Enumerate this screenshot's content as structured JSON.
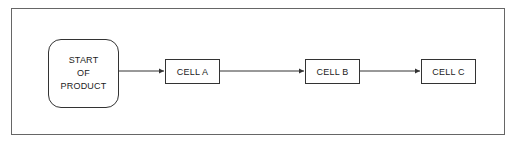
{
  "diagram": {
    "type": "flowchart",
    "start": {
      "lines": [
        "START",
        "OF",
        "PRODUCT"
      ]
    },
    "cells": [
      {
        "label": "CELL A"
      },
      {
        "label": "CELL B"
      },
      {
        "label": "CELL C"
      }
    ],
    "edges": [
      {
        "from": "START OF PRODUCT",
        "to": "CELL A"
      },
      {
        "from": "CELL A",
        "to": "CELL B"
      },
      {
        "from": "CELL B",
        "to": "CELL C"
      }
    ],
    "colors": {
      "line": "#333333",
      "frame": "#666666",
      "background": "#ffffff"
    }
  }
}
